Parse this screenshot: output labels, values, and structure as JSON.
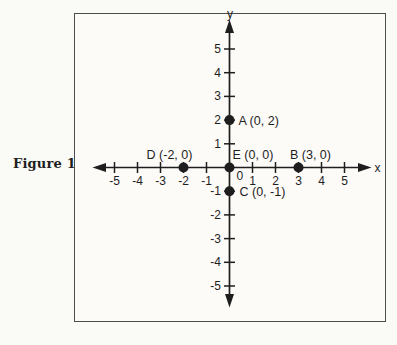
{
  "figure": {
    "caption": "Figure 17"
  },
  "chart_data": {
    "type": "scatter",
    "title": "",
    "xlabel": "x",
    "ylabel": "y",
    "xlim": [
      -6,
      6
    ],
    "ylim": [
      -6,
      6
    ],
    "x_ticks": [
      -5,
      -4,
      -3,
      -2,
      -1,
      1,
      2,
      3,
      4,
      5
    ],
    "y_ticks": [
      -5,
      -4,
      -3,
      -2,
      -1,
      1,
      2,
      3,
      4,
      5
    ],
    "origin_label": "0",
    "grid": false,
    "legend": "none",
    "points": [
      {
        "name": "A",
        "x": 0,
        "y": 2,
        "label": "A (0, 2)",
        "anchor": "start",
        "dx": 9,
        "dy": 4.5
      },
      {
        "name": "B",
        "x": 3,
        "y": 0,
        "label": "B (3, 0)",
        "anchor": "middle",
        "dx": 12,
        "dy": -9
      },
      {
        "name": "C",
        "x": 0,
        "y": -1,
        "label": "C (0, -1)",
        "anchor": "start",
        "dx": 10,
        "dy": 5
      },
      {
        "name": "D",
        "x": -2,
        "y": 0,
        "label": "D (-2, 0)",
        "anchor": "middle",
        "dx": -14,
        "dy": -9
      },
      {
        "name": "E",
        "x": 0,
        "y": 0,
        "label": "E (0, 0)",
        "anchor": "start",
        "dx": 3,
        "dy": -9
      }
    ],
    "colors": {
      "ink": "#1e1e1e",
      "paper": "#fbfaf6",
      "frame": "#4d4d4d"
    }
  }
}
